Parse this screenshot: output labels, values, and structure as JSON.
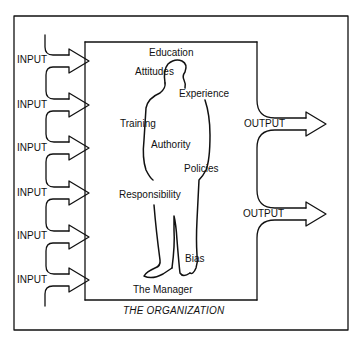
{
  "diagram": {
    "type": "organization-input-output",
    "caption": "THE ORGANIZATION",
    "figure_label": "The Manager",
    "input_label": "INPUT",
    "output_label": "OUTPUT",
    "inputs": [
      {
        "label": "INPUT"
      },
      {
        "label": "INPUT"
      },
      {
        "label": "INPUT"
      },
      {
        "label": "INPUT"
      },
      {
        "label": "INPUT"
      },
      {
        "label": "INPUT"
      }
    ],
    "outputs": [
      {
        "label": "OUTPUT"
      },
      {
        "label": "OUTPUT"
      }
    ],
    "attributes": [
      {
        "label": "Education"
      },
      {
        "label": "Attitudes"
      },
      {
        "label": "Experience"
      },
      {
        "label": "Training"
      },
      {
        "label": "Authority"
      },
      {
        "label": "Policies"
      },
      {
        "label": "Responsibility"
      },
      {
        "label": "Bias"
      }
    ],
    "colors": {
      "line": "#111111",
      "background": "#ffffff"
    }
  }
}
